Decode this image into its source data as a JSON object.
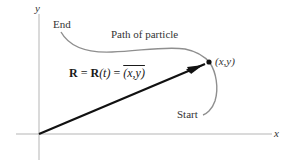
{
  "diagram": {
    "axes": {
      "x_label": "x",
      "y_label": "y"
    },
    "labels": {
      "end": "End",
      "start": "Start",
      "path": "Path of particle",
      "point": "(x,y)"
    },
    "equation": {
      "lhs": "R",
      "eq1": " = ",
      "func_R": "R",
      "func_arg": "(t)",
      "eq2": " = ",
      "rhs": "(x,y)"
    },
    "colors": {
      "axis": "#b0b0b0",
      "curve": "#8c8c8c",
      "vector": "#111111",
      "text": "#333333"
    }
  }
}
